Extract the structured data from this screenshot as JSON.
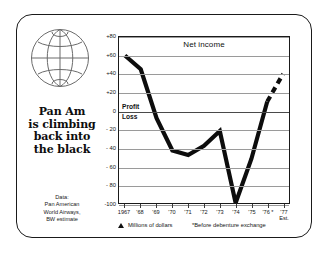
{
  "brand": {
    "logo_icon": "pan-am-globe-icon"
  },
  "headline": {
    "lines": [
      "Pan Am",
      "is climbing",
      "back into",
      "the black"
    ]
  },
  "source": {
    "lines": [
      "Data:",
      "Pan American",
      "World Airways,",
      "BW estimate"
    ]
  },
  "legend": {
    "marker_icon": "triangle-icon",
    "unit": "Millions of dollars",
    "footnote": "*Before debenture exchange"
  },
  "annotations": {
    "profit": "Profit",
    "loss": "Loss"
  },
  "chart_data": {
    "type": "line",
    "title": "Net income",
    "xlabel": "",
    "ylabel": "Millions of dollars",
    "ylim": [
      -100,
      80
    ],
    "yticks": [
      80,
      60,
      40,
      20,
      0,
      -20,
      -40,
      -60,
      -80,
      -100
    ],
    "ytick_labels": [
      "+80",
      "+60",
      "+40",
      "+20",
      "0",
      "- 20",
      "- 40",
      "- 60",
      "- 80",
      "-100"
    ],
    "grid": true,
    "legend_position": "none",
    "categories": [
      "1967",
      "'68",
      "'69",
      "'70",
      "'71",
      "'72",
      "'73",
      "'74",
      "'75",
      "'76 *",
      "'77 Est."
    ],
    "values": [
      60,
      45,
      -8,
      -43,
      -48,
      -38,
      -22,
      -100,
      -52,
      10,
      40
    ],
    "series": [
      {
        "name": "Net income",
        "style": "solid",
        "values": [
          60,
          45,
          -8,
          -43,
          -48,
          -38,
          -22,
          -100,
          -52,
          10,
          null
        ]
      },
      {
        "name": "Net income (estimate)",
        "style": "dashed",
        "values": [
          null,
          null,
          null,
          null,
          null,
          null,
          null,
          null,
          null,
          10,
          40
        ]
      }
    ]
  }
}
